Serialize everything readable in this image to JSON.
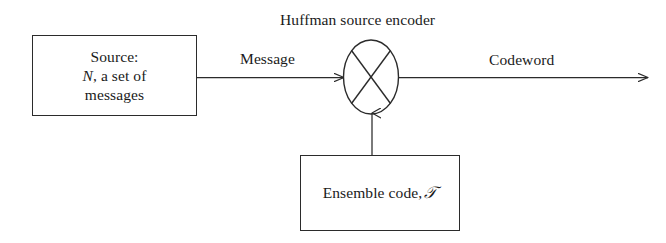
{
  "diagram": {
    "title": "Huffman source encoder",
    "nodes": {
      "source": {
        "line1": "Source:",
        "line2_var": "N",
        "line2_rest": ", a set of",
        "line3": "messages"
      },
      "encoder": {
        "symbol_name": "crossed-circle-mixer",
        "label": "Huffman source encoder"
      },
      "ensemble": {
        "text": "Ensemble code,",
        "var": "𝒯"
      }
    },
    "edges": {
      "message": "Message",
      "codeword": "Codeword",
      "control": ""
    },
    "style": {
      "stroke": "#2b2b2b",
      "background": "#ffffff",
      "text_color": "#1a1a1a"
    }
  }
}
